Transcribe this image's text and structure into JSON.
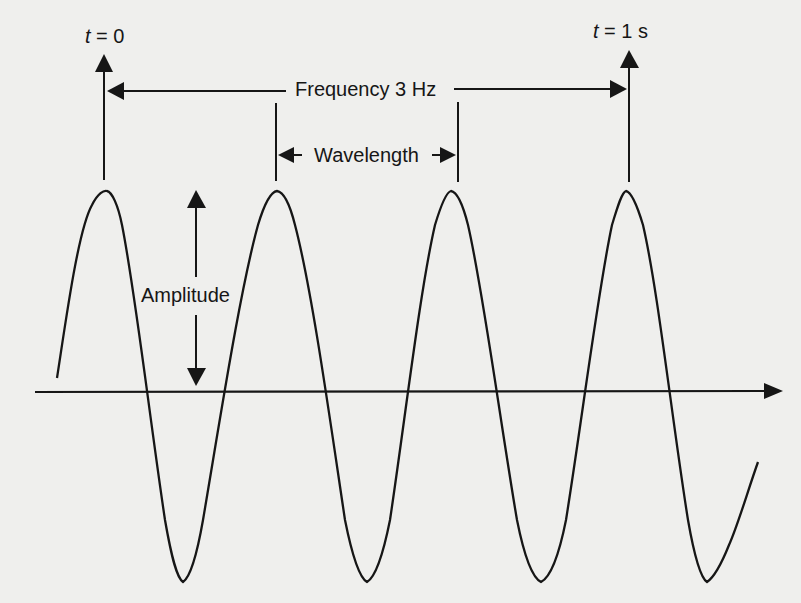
{
  "diagram": {
    "labels": {
      "t_start_var": "t",
      "t_start_value": " = 0",
      "t_end_var": "t",
      "t_end_value": " = 1 s",
      "frequency": "Frequency 3 Hz",
      "wavelength": "Wavelength",
      "amplitude": "Amplitude"
    },
    "colors": {
      "line": "#161616",
      "background": "#efefed"
    },
    "wave": {
      "cycles_shown": 4,
      "peak_x": [
        107,
        277,
        451,
        626
      ],
      "trough_x": [
        183,
        367,
        541,
        707
      ],
      "peak_y": 192,
      "trough_y": 582,
      "axis_y": 392
    }
  }
}
